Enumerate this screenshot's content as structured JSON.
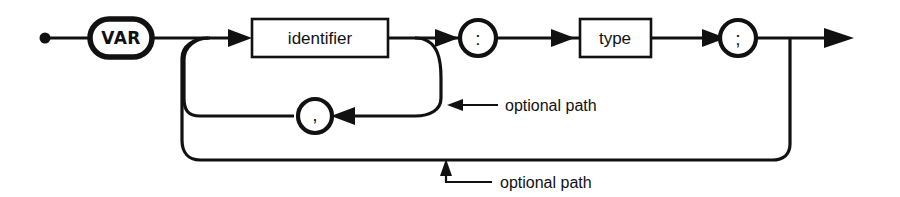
{
  "diagram": {
    "kind": "railroad-syntax-diagram",
    "background_color": "#ffffff",
    "line_color": "#111111",
    "nodes": {
      "start": {
        "name": "start-dot",
        "shape": "filled-dot"
      },
      "var_keyword": {
        "label": "VAR",
        "shape": "stadium",
        "kind": "terminal"
      },
      "identifier": {
        "label": "identifier",
        "shape": "rectangle",
        "kind": "nonterminal"
      },
      "colon": {
        "label": ":",
        "shape": "circle",
        "kind": "terminal"
      },
      "type": {
        "label": "type",
        "shape": "rectangle",
        "kind": "nonterminal"
      },
      "semicolon": {
        "label": ";",
        "shape": "circle",
        "kind": "terminal"
      },
      "comma": {
        "label": ",",
        "shape": "circle",
        "kind": "terminal"
      }
    },
    "annotations": [
      {
        "id": "annot-comma-loop",
        "text": "optional path"
      },
      {
        "id": "annot-outer-loop",
        "text": "optional path"
      }
    ]
  }
}
